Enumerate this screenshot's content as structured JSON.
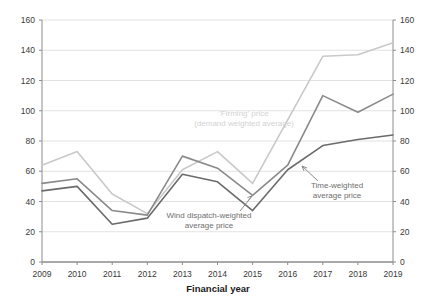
{
  "chart_data": {
    "type": "line",
    "title": "",
    "xlabel": "Financial year",
    "ylabel": "",
    "categories": [
      "2009",
      "2010",
      "2011",
      "2012",
      "2013",
      "2014",
      "2015",
      "2016",
      "2017",
      "2018",
      "2019"
    ],
    "x_tick_labels": [
      "2009",
      "2010",
      "2011",
      "2012",
      "2013",
      "2014",
      "2015",
      "2016",
      "2017",
      "2018",
      "2019"
    ],
    "y_tick_labels": [
      "0",
      "20",
      "40",
      "60",
      "80",
      "100",
      "120",
      "140",
      "160"
    ],
    "y_tick_labels_right": [
      "0",
      "20",
      "40",
      "60",
      "80",
      "100",
      "120",
      "140",
      "160"
    ],
    "ylim": [
      0,
      160
    ],
    "y_tick_step": 20,
    "grid": "horizontal",
    "legend": "annotations",
    "series": [
      {
        "name": "'Firming' price (demand weighted average)",
        "color": "#c9c9c9",
        "values": [
          64,
          73,
          45,
          32,
          61,
          73,
          52,
          94,
          136,
          137,
          145
        ]
      },
      {
        "name": "Time-weighted average price",
        "color": "#8a8a8a",
        "values": [
          52,
          55,
          34,
          31,
          70,
          62,
          44,
          64,
          110,
          99,
          111
        ]
      },
      {
        "name": "Wind dispatch-weighted average price",
        "color": "#6b6b6b",
        "values": [
          47,
          50,
          25,
          29,
          58,
          53,
          34,
          61,
          77,
          81,
          84
        ]
      }
    ],
    "annotations": [
      {
        "id": "firming-price",
        "lines": [
          "'Firming' price",
          "(demand weighted average)"
        ],
        "color": "#d2d2d2"
      },
      {
        "id": "wind-dispatch-weighted",
        "lines": [
          "Wind dispatch-weighted",
          "average price"
        ],
        "color": "#6e6e6e"
      },
      {
        "id": "time-weighted",
        "lines": [
          "Time-weighted",
          "average price"
        ],
        "color": "#6e6e6e"
      }
    ]
  },
  "axis": {
    "x_title": "Financial year"
  },
  "colors": {
    "axis": "#8c8c8c",
    "grid": "#e2e2e2",
    "text": "#3a3a3a",
    "firming": "#c9c9c9",
    "time_weighted": "#8a8a8a",
    "wind_dispatch": "#6b6b6b"
  }
}
